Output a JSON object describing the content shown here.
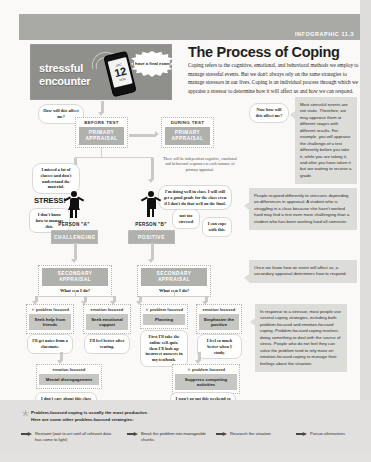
{
  "band": {
    "tag": "INFOGRAPHIC 11.3"
  },
  "header": {
    "title": "The Process of Coping",
    "intro": "Coping refers to the cognitive, emotional, and behavioral methods we employ to manage stressful events. But we don't always rely on the same strategies to manage stressors in our lives. Coping is an individual process through which we appraise a stressor to determine how it will affect us and how we can respond."
  },
  "hero": {
    "label_line1": "stressful",
    "label_line2": "encounter",
    "burst": "I have a final exam!",
    "phone_number": "12",
    "phone_top": "DEC",
    "phone_bottom": "MON"
  },
  "flow": {
    "bubble_how_affect": "How will this affect me?",
    "before_test": {
      "caption": "BEFORE TEST",
      "band": "PRIMARY APPRAISAL"
    },
    "during_test": {
      "caption": "DURING TEST",
      "band": "PRIMARY APPRAISAL"
    },
    "bubble_missed": "I missed a lot of classes and don't understand the material.",
    "during_note": "There will be independent cognitive, emotional and behavioral responses to each instance of primary appraisal.",
    "bubble_doing_well": "I'm doing well in class. I will still get a good grade for the class even if I don't do that well on the final.",
    "stress_word": "STRESS!",
    "bubble_dont_know": "I don't know how to manage this.",
    "bubble_not_stressed": "not too stressed",
    "bubble_can_cope": "I can cope with this.",
    "person_a": {
      "label": "PERSON \"A\"",
      "band": "CHALLENGING"
    },
    "person_b": {
      "label": "PERSON \"B\"",
      "band": "POSITIVE"
    },
    "secondary_left": {
      "band": "SECONDARY APPRAISAL",
      "q": "What can I do?"
    },
    "secondary_right": {
      "band": "SECONDARY APPRAISAL",
      "q": "What can I do?"
    }
  },
  "coping": [
    {
      "kind": "problem focused",
      "action": "Seek help from friends",
      "quote": "I'll get notes from a classmate.",
      "star": true
    },
    {
      "kind": "emotion focused",
      "action": "Seek emotional support",
      "quote": "I'll feel better after venting.",
      "star": false
    },
    {
      "kind": "problem focused",
      "action": "Planning",
      "quote": "First I'll take the online self-quiz, then I'll look up incorrect answers in my textbook.",
      "star": true
    },
    {
      "kind": "emotion focused",
      "action": "Emphasize the positive",
      "quote": "I feel so much better when I study.",
      "star": false
    },
    {
      "kind": "emotion focused",
      "action": "Mental disengagement",
      "quote": "I don't care about this class anymore.",
      "star": false
    },
    {
      "kind": "problem focused",
      "action": "Suppress competing activities",
      "quote": "I won't go out this weekend so I can focus on studying.",
      "star": true
    }
  ],
  "notes": [
    {
      "text": "Most stressful events are not static. Therefore, we may appraise them at different stages with different results. For example, you will appraise the challenge of a test differently before you take it, while you are taking it, and after you have taken it but are waiting to receive a grade."
    },
    {
      "text": "People respond differently to stressors depending on differences in appraisal. A student who is struggling in a class because she hasn't worked hard may find a test even more challenging than a student who has been working hard all semester."
    },
    {
      "text": "Once we know how an event will affect us, a secondary appraisal determines how to respond."
    },
    {
      "text": "In response to a stressor, most people use several coping strategies, including both problem-focused and emotion-focused coping. Problem-focused coping involves doing something to deal with the source of stress. People who do not feel they can solve the problem tend to rely more on emotion-focused coping to manage their feelings about the situation."
    }
  ],
  "note_label": {
    "now": "Now",
    "rest": "how will this affect me?"
  },
  "legend": {
    "headline_line1": "Problem-focused coping is usually the most productive.",
    "headline_line2": "Here are some other problem-focused strategies:",
    "items": [
      "Restraint (wait to act until all relevant data has come to light)",
      "Break the problem into manageable chunks",
      "Research the situation",
      "Pursue alternatives"
    ]
  }
}
